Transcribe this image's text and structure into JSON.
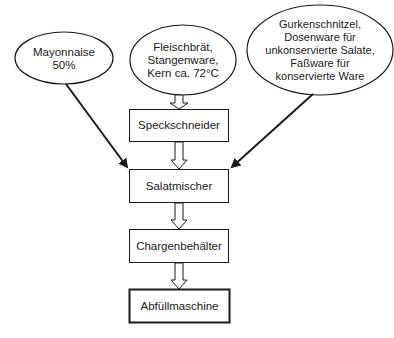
{
  "diagram": {
    "type": "flowchart",
    "inputs": [
      {
        "id": "mayonnaise",
        "label": "Mayonnaise\n50%"
      },
      {
        "id": "fleischbraet",
        "label": "Fleischbrät,\nStangenware,\nKern ca. 72°C"
      },
      {
        "id": "gurken",
        "label": "Gurkenschnitzel,\nDosenware für\nunkonservierte Salate,\nFaßware für\nkonservierte Ware"
      }
    ],
    "steps": [
      {
        "id": "speckschneider",
        "label": "Speckschneider"
      },
      {
        "id": "salatmischer",
        "label": "Salatmischer"
      },
      {
        "id": "chargenbehaelter",
        "label": "Chargenbehälter"
      },
      {
        "id": "abfuellmaschine",
        "label": "Abfüllmaschine"
      }
    ],
    "edges": [
      {
        "from": "fleischbraet",
        "to": "speckschneider",
        "style": "hollow-arrow"
      },
      {
        "from": "speckschneider",
        "to": "salatmischer",
        "style": "hollow-arrow"
      },
      {
        "from": "mayonnaise",
        "to": "salatmischer",
        "style": "line-arrow"
      },
      {
        "from": "gurken",
        "to": "salatmischer",
        "style": "line-arrow"
      },
      {
        "from": "salatmischer",
        "to": "chargenbehaelter",
        "style": "hollow-arrow"
      },
      {
        "from": "chargenbehaelter",
        "to": "abfuellmaschine",
        "style": "hollow-arrow"
      }
    ]
  }
}
